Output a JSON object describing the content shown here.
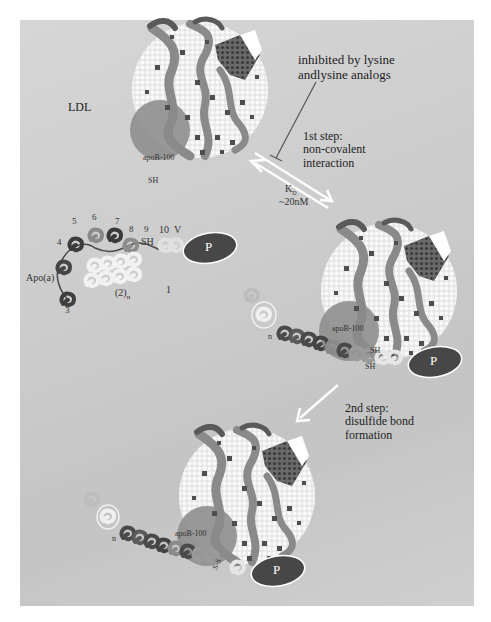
{
  "figure": {
    "background_color": "#c9c9c9",
    "particle_color": "#f2f2f2",
    "apob_region_color": "#8c8c8c",
    "kringle_dark": "#4a4a4a",
    "kringle_mid": "#7a7a7a",
    "kringle_light": "#ececec",
    "protease_color": "#474747"
  },
  "labels": {
    "ldl": "LDL",
    "inhibition_note": "inhibited by lysine\nandlysine analogs",
    "step1": "1st step:\nnon-covalent\ninteraction",
    "kd_symbol": "K",
    "kd_subscript": "D",
    "kd_value": "~20nM",
    "step2": "2nd step:\ndisulfide bond\nformation",
    "apoa": "Apo(a)",
    "repeat": "(2)",
    "repeat_subscript": "n",
    "kringle_1": "1",
    "kringle_3": "3",
    "kringle_4": "4",
    "kringle_5": "5",
    "kringle_6": "6",
    "kringle_7": "7",
    "kringle_8": "8",
    "kringle_9": "9",
    "kringle_10": "10",
    "kringle_v": "V",
    "sh": "SH",
    "protease": "P",
    "apob_top": "apoB-100",
    "sh_top": "SH",
    "apob_mid": "apoB-100",
    "sh_mid_1": "SH",
    "sh_mid_2": "SH",
    "n_mid": "n",
    "apob_bottom": "apoB-100",
    "ss_bottom": "S-S",
    "n_bottom": "n"
  }
}
